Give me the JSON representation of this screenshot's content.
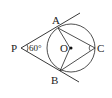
{
  "diagram": {
    "points": {
      "P": {
        "label": "P",
        "x": 21,
        "y": 48
      },
      "A": {
        "label": "A",
        "x": 57,
        "y": 27
      },
      "B": {
        "label": "B",
        "x": 60,
        "y": 71
      },
      "O": {
        "label": "O",
        "x": 70,
        "y": 48
      },
      "C": {
        "label": "C",
        "x": 95,
        "y": 48
      }
    },
    "circle": {
      "cx": 71,
      "cy": 48,
      "r": 24
    },
    "angle_label": "60°",
    "line_color": "#222222"
  }
}
